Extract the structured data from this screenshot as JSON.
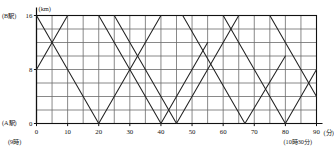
{
  "figure": {
    "kind": "train-diagram",
    "axis_labels": {
      "y_unit": "(km)",
      "x_unit": "(分)",
      "y_top_station": "(B駅)",
      "y_bottom_station": "(A駅)",
      "x_start_time": "(9時)",
      "x_end_time": "(10時30分)"
    },
    "y_ticks": [
      "0",
      "8",
      "16"
    ],
    "x_ticks": [
      "0",
      "10",
      "20",
      "30",
      "40",
      "50",
      "60",
      "70",
      "80",
      "90"
    ],
    "colors": {
      "grid": "#6b6b6b",
      "axis": "#111111",
      "line": "#222222",
      "background": "#ffffff"
    }
  },
  "chart_data": {
    "type": "line",
    "title": "",
    "xlabel": "(分)",
    "ylabel": "(km)",
    "xlim": [
      0,
      90
    ],
    "ylim": [
      0,
      16
    ],
    "x_tick_values": [
      0,
      10,
      20,
      30,
      40,
      50,
      60,
      70,
      80,
      90
    ],
    "y_tick_values": [
      0,
      8,
      16
    ],
    "x_gridline_step": 5,
    "y_gridline_step": 2,
    "grid": true,
    "legend": "none",
    "series": [
      {
        "name": "down-train-1",
        "direction": "B-to-A",
        "points": [
          [
            0,
            16
          ],
          [
            20,
            0
          ]
        ]
      },
      {
        "name": "down-train-2",
        "direction": "B-to-A",
        "points": [
          [
            20,
            16
          ],
          [
            40,
            0
          ]
        ]
      },
      {
        "name": "down-train-3",
        "direction": "B-to-A",
        "points": [
          [
            25,
            16
          ],
          [
            45,
            0
          ]
        ]
      },
      {
        "name": "down-train-4",
        "direction": "B-to-A",
        "points": [
          [
            47,
            16
          ],
          [
            67,
            0
          ]
        ]
      },
      {
        "name": "down-train-5",
        "direction": "B-to-A",
        "points": [
          [
            60,
            16
          ],
          [
            80,
            0
          ]
        ]
      },
      {
        "name": "down-train-6",
        "direction": "B-to-A",
        "points": [
          [
            75,
            16
          ],
          [
            90,
            4
          ]
        ]
      },
      {
        "name": "up-train-1",
        "direction": "A-to-B",
        "points": [
          [
            0,
            8
          ],
          [
            10,
            16
          ]
        ]
      },
      {
        "name": "up-train-2",
        "direction": "A-to-B",
        "points": [
          [
            20,
            0
          ],
          [
            40,
            16
          ]
        ]
      },
      {
        "name": "up-train-3",
        "direction": "A-to-B",
        "points": [
          [
            40,
            0
          ],
          [
            55,
            12
          ]
        ]
      },
      {
        "name": "up-train-4",
        "direction": "A-to-B",
        "points": [
          [
            45,
            0
          ],
          [
            65,
            16
          ]
        ]
      },
      {
        "name": "up-train-5",
        "direction": "A-to-B",
        "points": [
          [
            67,
            0
          ],
          [
            80,
            10
          ]
        ]
      },
      {
        "name": "up-train-6",
        "direction": "A-to-B",
        "points": [
          [
            80,
            0
          ],
          [
            90,
            8
          ]
        ]
      }
    ]
  }
}
